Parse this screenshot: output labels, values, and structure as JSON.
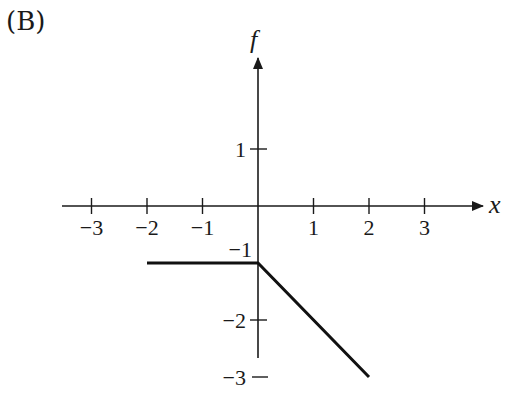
{
  "panel_label": "(B)",
  "chart_data": {
    "type": "line",
    "title": "",
    "xlabel": "x",
    "ylabel": "f",
    "x_ticks": [
      -3,
      -2,
      -1,
      1,
      2,
      3
    ],
    "x_tick_labels": [
      "−3",
      "−2",
      "−1",
      "1",
      "2",
      "3"
    ],
    "y_ticks": [
      1,
      -1,
      -2,
      -3
    ],
    "y_tick_labels": [
      "1",
      "−1",
      "−2",
      "−3"
    ],
    "xlim": [
      -3.5,
      4.2
    ],
    "ylim": [
      -3.2,
      2.7
    ],
    "grid": false,
    "legend": null,
    "series": [
      {
        "name": "f(x)",
        "x": [
          -2,
          0,
          2
        ],
        "y": [
          -1,
          -1,
          -3
        ]
      }
    ]
  }
}
